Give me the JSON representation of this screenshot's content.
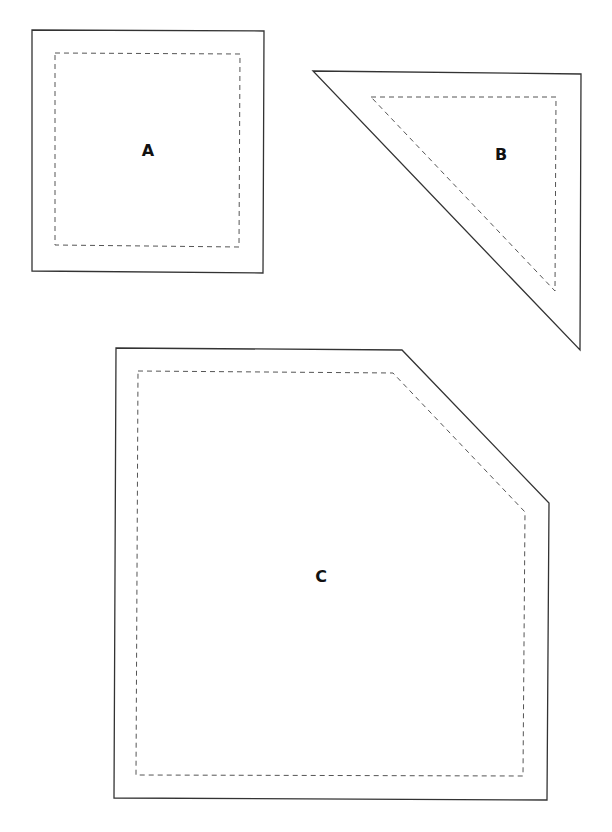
{
  "pieces": [
    {
      "label": "A",
      "shape": "square",
      "outer": "32,30 264,31 263,273 32,271",
      "inner": "55,53 240,54 239,247 55,245",
      "label_pos": [
        148,
        151
      ]
    },
    {
      "label": "B",
      "shape": "right-triangle",
      "outer": "313,71 581,74 580,350",
      "inner": "371,97 556,97 555,291",
      "label_pos": [
        501,
        155
      ]
    },
    {
      "label": "C",
      "shape": "pentagon (square with clipped corner)",
      "outer": "116,348 402,350 549,503 547,800 114,798",
      "inner": "138,371 393,373 525,512 523,776 136,775",
      "label_pos": [
        321,
        577
      ]
    }
  ],
  "colors": {
    "outline": "#333333",
    "seam": "#555555",
    "label": "#111111"
  }
}
